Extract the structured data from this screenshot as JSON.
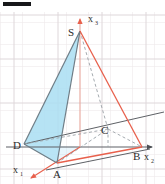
{
  "figure": {
    "type": "geometry-diagram",
    "canvas": {
      "width": 165,
      "height": 184,
      "background": "#ffffff"
    },
    "colors": {
      "grid": "#e9e2e4",
      "grid_major": "#dcd6d9",
      "axis": "#5e6166",
      "edge_gray": "#5e6166",
      "edge_red": "#e8604c",
      "face_fill": "#a9def2",
      "face_stroke": "#6f7d86",
      "dashed": "#9aa0a6",
      "label": "#2b2b2b",
      "top_bar": "#17181a"
    },
    "grid": {
      "spacing": 22,
      "visible": true
    },
    "vertices": [
      {
        "name": "S",
        "label": "S",
        "x": 80,
        "y": 31,
        "label_x": 68,
        "label_y": 32
      },
      {
        "name": "A",
        "label": "A",
        "x": 57,
        "y": 163,
        "label_x": 54,
        "label_y": 177
      },
      {
        "name": "B",
        "label": "B",
        "x": 142,
        "y": 147,
        "label_x": 136,
        "label_y": 160
      },
      {
        "name": "C",
        "label": "C",
        "x": 108,
        "y": 129,
        "label_x": 102,
        "label_y": 131
      },
      {
        "name": "D",
        "label": "D",
        "x": 24,
        "y": 144,
        "label_x": 14,
        "label_y": 148
      }
    ],
    "axes": [
      {
        "name": "x1",
        "label": "x",
        "sub": "1",
        "label_x": 16,
        "label_y": 172,
        "from": [
          80,
          147
        ],
        "to": [
          27,
          181
        ]
      },
      {
        "name": "x2",
        "label": "x",
        "sub": "2",
        "label_x": 148,
        "label_y": 160,
        "from": [
          6,
          147
        ],
        "to": [
          158,
          147
        ]
      },
      {
        "name": "x3",
        "label": "x",
        "sub": "3",
        "label_x": 91,
        "label_y": 21,
        "from": [
          80,
          147
        ],
        "to": [
          80,
          13
        ]
      }
    ],
    "shaded_face": {
      "name": "face-SDA",
      "points": "80,31 24,144 57,163",
      "fill": "#a9def2"
    },
    "edges": [
      {
        "name": "edge-S-D",
        "color": "#6f7d86",
        "style": "solid",
        "from": [
          80,
          31
        ],
        "to": [
          24,
          144
        ]
      },
      {
        "name": "edge-S-A",
        "color": "#6f7d86",
        "style": "solid",
        "from": [
          80,
          31
        ],
        "to": [
          57,
          163
        ]
      },
      {
        "name": "edge-S-B",
        "color": "#e8604c",
        "style": "solid",
        "from": [
          80,
          31
        ],
        "to": [
          142,
          147
        ]
      },
      {
        "name": "edge-S-C",
        "color": "#9aa0a6",
        "style": "dashed",
        "from": [
          80,
          31
        ],
        "to": [
          108,
          129
        ]
      },
      {
        "name": "edge-D-A",
        "color": "#6f7d86",
        "style": "solid",
        "from": [
          24,
          144
        ],
        "to": [
          57,
          163
        ]
      },
      {
        "name": "edge-A-B",
        "color": "#e8604c",
        "style": "solid",
        "from": [
          57,
          163
        ],
        "to": [
          142,
          147
        ]
      },
      {
        "name": "edge-D-C",
        "color": "#9aa0a6",
        "style": "dashed",
        "from": [
          24,
          144
        ],
        "to": [
          108,
          129
        ]
      },
      {
        "name": "edge-C-B",
        "color": "#9aa0a6",
        "style": "dashed",
        "from": [
          108,
          129
        ],
        "to": [
          142,
          147
        ]
      },
      {
        "name": "edge-A-C",
        "color": "#9aa0a6",
        "style": "dashed",
        "from": [
          57,
          163
        ],
        "to": [
          108,
          129
        ]
      },
      {
        "name": "ray-D-B",
        "color": "#5e6166",
        "style": "solid",
        "from": [
          24,
          144
        ],
        "to": [
          163,
          113
        ]
      },
      {
        "name": "ray-A-B",
        "color": "#5e6166",
        "style": "solid",
        "from": [
          45,
          170
        ],
        "to": [
          150,
          148
        ]
      }
    ],
    "top_bar": {
      "name": "crop-artifact-bar",
      "visible": true
    }
  }
}
